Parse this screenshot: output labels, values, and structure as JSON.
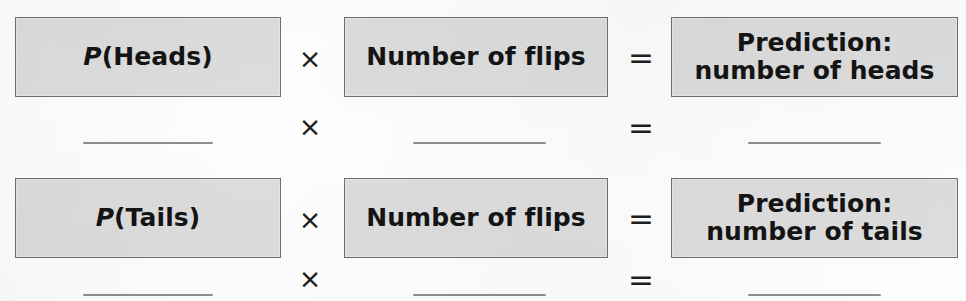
{
  "worksheet": {
    "title": "Prediction formula template",
    "rows": [
      {
        "id": "heads-row",
        "factor1": "P(Heads)",
        "factor1_variable": "P",
        "factor1_rest": "(Heads)",
        "operator_multiply": "×",
        "factor2": "Number of flips",
        "operator_equals": "=",
        "result_line1": "Prediction:",
        "result_line2": "number of heads"
      },
      {
        "id": "heads-answer-row",
        "operator_multiply": "×",
        "operator_equals": "=",
        "factor1_blank": "",
        "factor2_blank": "",
        "result_blank": ""
      },
      {
        "id": "tails-row",
        "factor1": "P(Tails)",
        "factor1_variable": "P",
        "factor1_rest": "(Tails)",
        "operator_multiply": "×",
        "factor2": "Number of flips",
        "operator_equals": "=",
        "result_line1": "Prediction:",
        "result_line2": "number of tails"
      },
      {
        "id": "tails-answer-row",
        "operator_multiply": "×",
        "operator_equals": "=",
        "factor1_blank": "",
        "factor2_blank": "",
        "result_blank": ""
      }
    ],
    "colors": {
      "box_fill": "#dcdcdc",
      "box_border": "#6e6e6e",
      "text": "#141414",
      "blank_line": "#8d8d8d",
      "background": "#fdfdfd"
    }
  }
}
